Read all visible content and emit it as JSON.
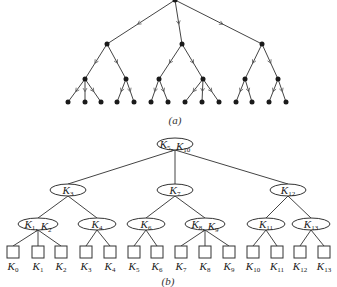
{
  "figure_a": {
    "caption": "(a)",
    "root": {
      "x": 175,
      "y": 0
    },
    "level1": [
      {
        "x": 107,
        "y": 44
      },
      {
        "x": 182,
        "y": 44
      },
      {
        "x": 262,
        "y": 44
      }
    ],
    "level2": [
      {
        "x": 85,
        "y": 79,
        "parent": 0
      },
      {
        "x": 126,
        "y": 79,
        "parent": 0
      },
      {
        "x": 159,
        "y": 79,
        "parent": 1
      },
      {
        "x": 203,
        "y": 79,
        "parent": 1
      },
      {
        "x": 245,
        "y": 79,
        "parent": 2
      },
      {
        "x": 278,
        "y": 79,
        "parent": 2
      }
    ],
    "leaves": [
      {
        "x": 68,
        "parent": 0
      },
      {
        "x": 85,
        "parent": 0
      },
      {
        "x": 101,
        "parent": 0
      },
      {
        "x": 117,
        "parent": 1
      },
      {
        "x": 134,
        "parent": 1
      },
      {
        "x": 151,
        "parent": 2
      },
      {
        "x": 168,
        "parent": 2
      },
      {
        "x": 185,
        "parent": 3
      },
      {
        "x": 202,
        "parent": 3
      },
      {
        "x": 219,
        "parent": 3
      },
      {
        "x": 236,
        "parent": 4
      },
      {
        "x": 252,
        "parent": 4
      },
      {
        "x": 269,
        "parent": 5
      },
      {
        "x": 286,
        "parent": 5
      }
    ],
    "leaf_y": 102
  },
  "figure_b": {
    "caption": "(b)",
    "root": {
      "x": 175,
      "y": 144,
      "w": 36,
      "keys": [
        {
          "k": "K",
          "s": "5"
        },
        {
          "k": "K",
          "s": "10"
        }
      ]
    },
    "level1": [
      {
        "x": 68,
        "y": 190,
        "w": 36,
        "keys": [
          {
            "k": "K",
            "s": "3"
          }
        ]
      },
      {
        "x": 175,
        "y": 190,
        "w": 36,
        "keys": [
          {
            "k": "K",
            "s": "7"
          }
        ]
      },
      {
        "x": 288,
        "y": 190,
        "w": 36,
        "keys": [
          {
            "k": "K",
            "s": "12"
          }
        ]
      }
    ],
    "level2": [
      {
        "x": 38,
        "y": 224,
        "w": 40,
        "parent": 0,
        "keys": [
          {
            "k": "K",
            "s": "1"
          },
          {
            "k": "K",
            "s": "2"
          }
        ]
      },
      {
        "x": 97,
        "y": 224,
        "w": 38,
        "parent": 0,
        "keys": [
          {
            "k": "K",
            "s": "4"
          }
        ]
      },
      {
        "x": 146,
        "y": 224,
        "w": 38,
        "parent": 1,
        "keys": [
          {
            "k": "K",
            "s": "6"
          }
        ]
      },
      {
        "x": 205,
        "y": 224,
        "w": 40,
        "parent": 1,
        "keys": [
          {
            "k": "K",
            "s": "8"
          },
          {
            "k": "K",
            "s": "9"
          }
        ]
      },
      {
        "x": 266,
        "y": 224,
        "w": 38,
        "parent": 2,
        "keys": [
          {
            "k": "K",
            "s": "11"
          }
        ]
      },
      {
        "x": 311,
        "y": 224,
        "w": 38,
        "parent": 2,
        "keys": [
          {
            "k": "K",
            "s": "13"
          }
        ]
      }
    ],
    "leaves": [
      {
        "x": 13,
        "parent": 0,
        "label": "K",
        "sub": "0"
      },
      {
        "x": 38,
        "parent": 0,
        "label": "K",
        "sub": "1"
      },
      {
        "x": 61,
        "parent": 0,
        "label": "K",
        "sub": "2"
      },
      {
        "x": 86,
        "parent": 1,
        "label": "K",
        "sub": "3"
      },
      {
        "x": 110,
        "parent": 1,
        "label": "K",
        "sub": "4"
      },
      {
        "x": 134,
        "parent": 2,
        "label": "K",
        "sub": "5"
      },
      {
        "x": 157,
        "parent": 2,
        "label": "K",
        "sub": "6"
      },
      {
        "x": 181,
        "parent": 3,
        "label": "K",
        "sub": "7"
      },
      {
        "x": 205,
        "parent": 3,
        "label": "K",
        "sub": "8"
      },
      {
        "x": 229,
        "parent": 3,
        "label": "K",
        "sub": "9"
      },
      {
        "x": 253,
        "parent": 4,
        "label": "K",
        "sub": "10"
      },
      {
        "x": 277,
        "parent": 4,
        "label": "K",
        "sub": "11"
      },
      {
        "x": 300,
        "parent": 5,
        "label": "K",
        "sub": "12"
      },
      {
        "x": 324,
        "parent": 5,
        "label": "K",
        "sub": "13"
      }
    ],
    "box_y": 246,
    "box_size": 12,
    "label_y": 270
  }
}
